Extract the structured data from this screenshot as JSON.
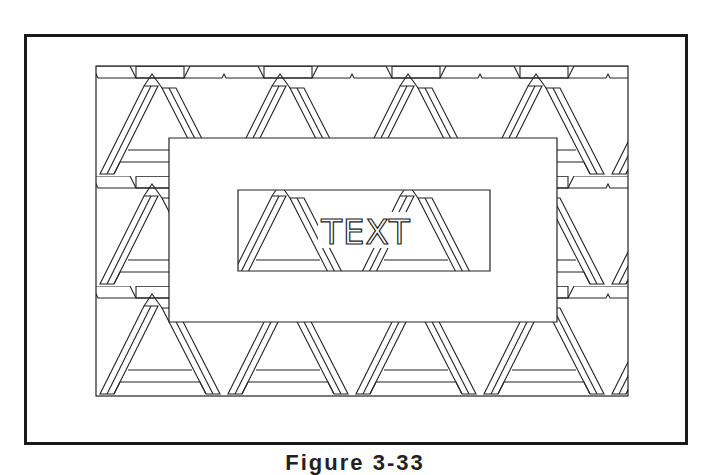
{
  "figure": {
    "type": "decorative border pattern drawing",
    "pattern": "interlaced triangle weave (woven bars)",
    "center_label": "TEXT",
    "caption": "Figure 3-33",
    "caption_note": "caption partially cropped at bottom edge",
    "colors": {
      "line": "#222222",
      "background": "#ffffff",
      "outer_frame": "#1a1a1a"
    },
    "regions": {
      "outer_frame": {
        "x": 24,
        "y": 34,
        "w": 661,
        "h": 408
      },
      "pattern_area": {
        "x": 96,
        "y": 66,
        "w": 532,
        "h": 330
      },
      "white_panel": {
        "x": 169,
        "y": 138,
        "w": 388,
        "h": 184
      },
      "text_window": {
        "x": 238,
        "y": 190,
        "w": 252,
        "h": 81
      }
    }
  }
}
